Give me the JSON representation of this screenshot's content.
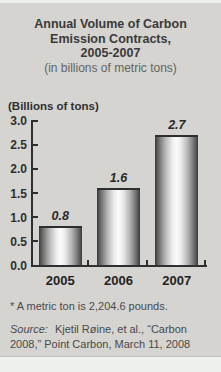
{
  "header": {
    "line1": "Annual Volume of Carbon",
    "line2": "Emission Contracts,",
    "line3": "2005-2007",
    "subtitle": "(in billions of metric tons)"
  },
  "chart_data": {
    "type": "bar",
    "title": "Annual Volume of Carbon Emission Contracts, 2005-2007",
    "subtitle": "(in billions of metric tons)",
    "ylabel": "(Billions of tons)",
    "xlabel": "",
    "categories": [
      "2005",
      "2006",
      "2007"
    ],
    "values": [
      0.8,
      1.6,
      2.7
    ],
    "bar_labels": [
      "0.8",
      "1.6",
      "2.7"
    ],
    "ylim": [
      0,
      3.0
    ],
    "yticks": [
      3.0,
      2.5,
      2.0,
      1.5,
      1.0,
      0.5,
      0.0
    ],
    "grid": false,
    "legend": "none",
    "bar_style": "metallic-gradient"
  },
  "footnote": "* A metric ton is 2,204.6 pounds.",
  "source": {
    "prefix": "Source:",
    "line1": "Kjetil Røine, et al., “Carbon",
    "line2": "2008,” Point Carbon, March 11, 2008"
  },
  "colors": {
    "card_background": "#d5d4d0",
    "page_background": "#eef0ee",
    "title_text": "#3a3a3a",
    "subtitle_text": "#646464",
    "axis_and_labels": "#2f2f2f",
    "footnote_text": "#4a4a4a",
    "bar_edge": "#3a3a3a",
    "bar_highlight": "#fbfbfb"
  }
}
